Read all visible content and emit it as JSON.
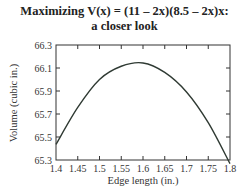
{
  "chart_data": {
    "type": "line",
    "title_line1": "Maximizing V(x) = (11 – 2x)(8.5 – 2x)x:",
    "title_line2": "a closer look",
    "xlabel": "Edge length (in.)",
    "ylabel": "Volume (cubic in.)",
    "xlim": [
      1.4,
      1.8
    ],
    "ylim": [
      65.3,
      66.3
    ],
    "x_ticks": [
      "1.4",
      "1.45",
      "1.5",
      "1.55",
      "1.6",
      "1.65",
      "1.7",
      "1.75",
      "1.8"
    ],
    "y_ticks": [
      "66.3",
      "66.1",
      "65.9",
      "65.7",
      "65.5",
      "65.3"
    ],
    "grid": false,
    "legend": null,
    "series": [
      {
        "name": "V(x)",
        "x": [
          1.4,
          1.45,
          1.5,
          1.55,
          1.6,
          1.65,
          1.7,
          1.75,
          1.8
        ],
        "values": [
          65.436,
          65.757,
          66.0,
          66.115,
          66.144,
          66.062,
          65.892,
          65.625,
          65.268
        ]
      }
    ],
    "line_color": "#2f3a33"
  }
}
